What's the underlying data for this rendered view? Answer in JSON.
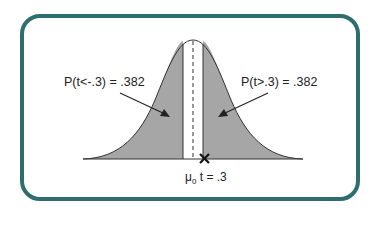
{
  "diagram": {
    "type": "t-distribution two-tailed probability illustration",
    "left_annotation": "P(t<-.3) = .382",
    "right_annotation": "P(t>.3) = .382",
    "mean_symbol": "μ",
    "mean_subscript": "0",
    "t_value_label": "t = .3",
    "colors": {
      "frame": "#2f6e6e",
      "shaded_tail": "#a6a6a6",
      "curve_line": "#333333",
      "text": "#222222"
    }
  }
}
